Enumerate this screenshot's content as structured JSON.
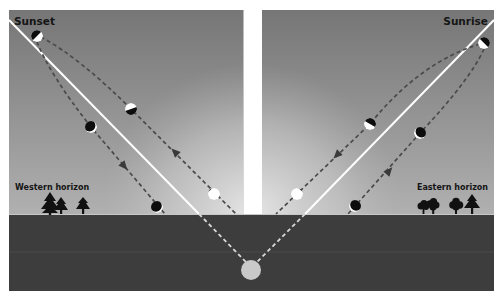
{
  "diagram": {
    "left_panel": {
      "title": "Sunset",
      "horizon_label": "Western horizon"
    },
    "right_panel": {
      "title": "Sunrise",
      "horizon_label": "Eastern horizon"
    },
    "colors": {
      "sky_top": "#767676",
      "sky_bottom": "#b4b4b4",
      "glow": "#e6e6e6",
      "ground": "#3d3d3d",
      "horizon_line": "#d0d0d0",
      "moon_light": "#ffffff",
      "moon_dark": "#0d0d0d",
      "hidden_moon": "#c9c9c9",
      "dashed_path": "#4a4a4a"
    },
    "icons": {
      "moon_phase": "moon-phase-icon",
      "direction_arrow": "arrow-icon",
      "conifer_tree": "conifer-tree-icon",
      "deciduous_tree": "deciduous-tree-icon"
    }
  }
}
